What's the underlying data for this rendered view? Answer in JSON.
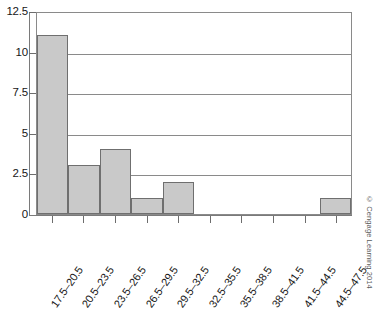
{
  "chart_data": {
    "type": "bar",
    "title": "",
    "subtitle": "",
    "xlabel": "",
    "ylabel": "",
    "categories": [
      "17.5–20.5",
      "20.5–23.5",
      "23.5–26.5",
      "26.5–29.5",
      "29.5–32.5",
      "32.5–35.5",
      "35.5–38.5",
      "38.5–41.5",
      "41.5–44.5",
      "44.5–47.5"
    ],
    "values": [
      11,
      3,
      4,
      1,
      2,
      0,
      0,
      0,
      0,
      1
    ],
    "ylim": [
      0,
      12.5
    ],
    "yticks": [
      0,
      2.5,
      5,
      7.5,
      10,
      12.5
    ],
    "ytick_labels": [
      "0",
      "2.5",
      "5",
      "7.5",
      "10",
      "12.5"
    ],
    "grid": true,
    "grid_axis": "y",
    "legend": false,
    "bar_gap": 0,
    "bar_fill": "#c9c9c9",
    "bar_edge": "#6f6f6f",
    "grid_color": "#8a8a8a",
    "axis_color": "#7a7a7a",
    "background": "#ffffff"
  },
  "credit": {
    "text": "© Cengage Learning 2014"
  }
}
